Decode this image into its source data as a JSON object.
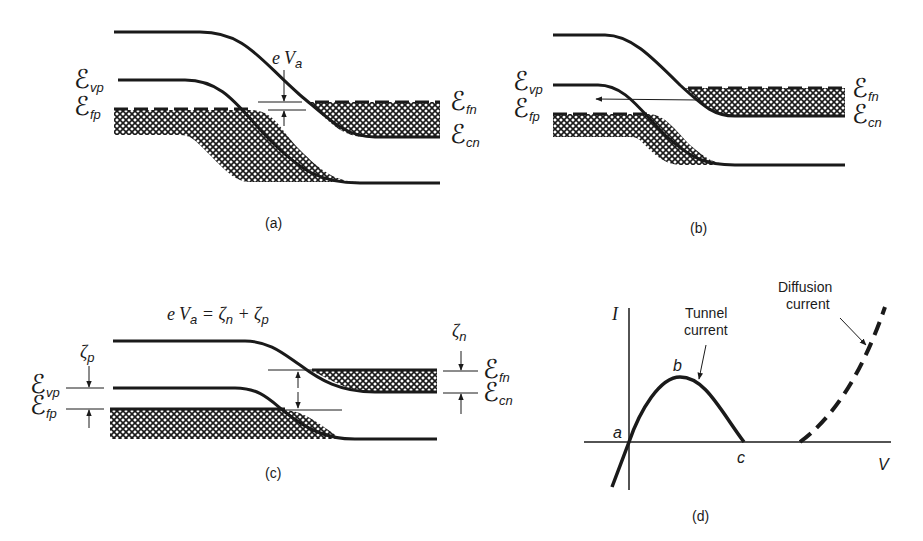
{
  "figure": {
    "panels": [
      {
        "id": "a",
        "caption": "(a)",
        "labels": {
          "evp": {
            "main": "ℰ",
            "sub": "vp"
          },
          "efp": {
            "main": "ℰ",
            "sub": "fp"
          },
          "efn": {
            "main": "ℰ",
            "sub": "fn"
          },
          "ecn": {
            "main": "ℰ",
            "sub": "cn"
          },
          "eva": {
            "e": "e",
            "v": "V",
            "sub": "a"
          }
        }
      },
      {
        "id": "b",
        "caption": "(b)",
        "labels": {
          "evp": {
            "main": "ℰ",
            "sub": "vp"
          },
          "efp": {
            "main": "ℰ",
            "sub": "fp"
          },
          "efn": {
            "main": "ℰ",
            "sub": "fn"
          },
          "ecn": {
            "main": "ℰ",
            "sub": "cn"
          }
        }
      },
      {
        "id": "c",
        "caption": "(c)",
        "equation": {
          "lhs_e": "e",
          "lhs_v": "V",
          "lhs_sub": "a",
          "eq": " = ",
          "zeta": "ζ",
          "n": "n",
          "plus": " + ",
          "p": "p"
        },
        "labels": {
          "zeta_p": {
            "main": "ζ",
            "sub": "p"
          },
          "zeta_n": {
            "main": "ζ",
            "sub": "n"
          },
          "evp": {
            "main": "ℰ",
            "sub": "vp"
          },
          "efp": {
            "main": "ℰ",
            "sub": "fp"
          },
          "efn": {
            "main": "ℰ",
            "sub": "fn"
          },
          "ecn": {
            "main": "ℰ",
            "sub": "cn"
          }
        }
      },
      {
        "id": "d",
        "caption": "(d)",
        "axis": {
          "y": "I",
          "x": "V"
        },
        "points": {
          "a": "a",
          "b": "b",
          "c": "c"
        },
        "annotations": {
          "tunnel_line1": "Tunnel",
          "tunnel_line2": "current",
          "diffusion_line1": "Diffusion",
          "diffusion_line2": "current"
        }
      }
    ]
  }
}
